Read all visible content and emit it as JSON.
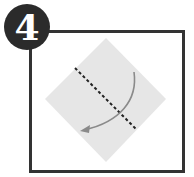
{
  "step": {
    "number": "4",
    "badge_color": "#2b2b2b",
    "frame_color": "#333333"
  },
  "diagram": {
    "paper_shape": "diamond-square",
    "paper_color": "#e6e6e6",
    "fold_line": "dashed-valley-fold",
    "fold_line_color": "#222222",
    "arrow": "curved-fold-arrow",
    "arrow_color": "#8a8a8a"
  }
}
